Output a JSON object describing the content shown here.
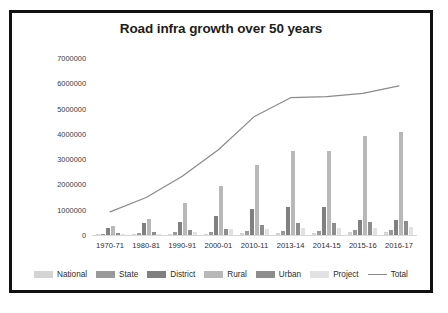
{
  "chart_data": {
    "type": "bar",
    "title": "Road infra growth over 50 years",
    "xlabel": "",
    "ylabel": "",
    "ylim": [
      0,
      7000000
    ],
    "ytick_labels": [
      "7000000",
      "6000000",
      "5000000",
      "4000000",
      "3000000",
      "2000000",
      "1000000",
      "0"
    ],
    "ytick_values": [
      7000000,
      6000000,
      5000000,
      4000000,
      3000000,
      2000000,
      1000000,
      0
    ],
    "grid": false,
    "legend_position": "bottom",
    "categories": [
      "1970-71",
      "1980-81",
      "1990-91",
      "2000-01",
      "2010-11",
      "2013-14",
      "2014-15",
      "2015-16",
      "2016-17"
    ],
    "series": [
      {
        "name": "National",
        "type": "bar",
        "color": "#d4d4d4",
        "values": [
          24000,
          32000,
          34000,
          58000,
          71000,
          92000,
          97000,
          101000,
          114000
        ]
      },
      {
        "name": "State",
        "type": "bar",
        "color": "#9a9a9a",
        "values": [
          56000,
          95000,
          127000,
          138000,
          164000,
          176000,
          178000,
          182000,
          186000
        ]
      },
      {
        "name": "District",
        "type": "bar",
        "color": "#808080",
        "values": [
          276000,
          492000,
          509000,
          737000,
          1024000,
          1106000,
          1108000,
          586000,
          612000
        ]
      },
      {
        "name": "Rural",
        "type": "bar",
        "color": "#b8b8b8",
        "values": [
          354000,
          628000,
          1260000,
          1944000,
          2750000,
          3320000,
          3340000,
          3930000,
          4060000
        ]
      },
      {
        "name": "Urban",
        "type": "bar",
        "color": "#8d8d8d",
        "values": [
          72000,
          123000,
          187000,
          253000,
          387000,
          467000,
          470000,
          526000,
          551000
        ]
      },
      {
        "name": "Project",
        "type": "bar",
        "color": "#e2e2e2",
        "values": [
          20000,
          25000,
          130000,
          223000,
          248000,
          276000,
          280000,
          290000,
          298000
        ]
      },
      {
        "name": "Total",
        "type": "line",
        "color": "#8a8a8a",
        "values": [
          914000,
          1485000,
          2327000,
          3373000,
          4690000,
          5430000,
          5470000,
          5600000,
          5900000
        ]
      }
    ]
  },
  "legend": {
    "items": [
      {
        "label": "National",
        "marker": "swatch"
      },
      {
        "label": "State",
        "marker": "swatch"
      },
      {
        "label": "District",
        "marker": "swatch"
      },
      {
        "label": "Rural",
        "marker": "swatch"
      },
      {
        "label": "Urban",
        "marker": "swatch"
      },
      {
        "label": "Project",
        "marker": "swatch"
      },
      {
        "label": "Total",
        "marker": "line"
      }
    ]
  }
}
